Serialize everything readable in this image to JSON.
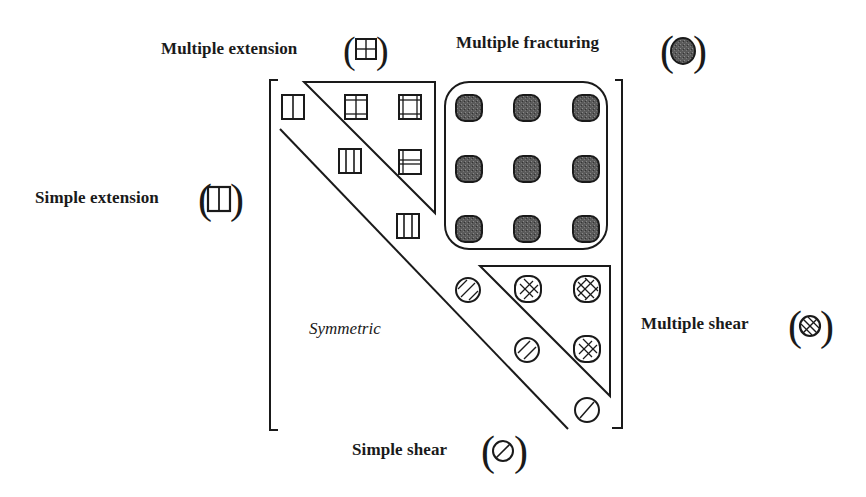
{
  "labels": {
    "multiple_extension": "Multiple extension",
    "multiple_fracturing": "Multiple fracturing",
    "simple_extension": "Simple extension",
    "multiple_shear": "Multiple shear",
    "simple_shear": "Simple shear",
    "symmetric": "Symmetric"
  },
  "legend_symbols": [
    {
      "label": "Multiple extension",
      "icon": "grid-square-icon"
    },
    {
      "label": "Multiple fracturing",
      "icon": "filled-rounded-square-icon"
    },
    {
      "label": "Simple extension",
      "icon": "split-square-icon"
    },
    {
      "label": "Multiple shear",
      "icon": "crosshatched-circle-icon"
    },
    {
      "label": "Simple shear",
      "icon": "slashed-circle-icon"
    }
  ],
  "matrix": {
    "size": 6,
    "description": "Upper-triangular symmetric matrix of fracture modes",
    "regions": [
      {
        "name": "Simple extension",
        "cells": [
          [
            1,
            1
          ],
          [
            2,
            2
          ],
          [
            3,
            3
          ]
        ]
      },
      {
        "name": "Multiple extension",
        "cells": [
          [
            1,
            2
          ],
          [
            1,
            3
          ],
          [
            2,
            3
          ]
        ]
      },
      {
        "name": "Multiple fracturing",
        "cells": [
          [
            1,
            4
          ],
          [
            1,
            5
          ],
          [
            1,
            6
          ],
          [
            2,
            4
          ],
          [
            2,
            5
          ],
          [
            2,
            6
          ],
          [
            3,
            4
          ],
          [
            3,
            5
          ],
          [
            3,
            6
          ]
        ]
      },
      {
        "name": "Simple shear",
        "cells": [
          [
            4,
            4
          ],
          [
            5,
            5
          ],
          [
            6,
            6
          ]
        ]
      },
      {
        "name": "Multiple shear",
        "cells": [
          [
            4,
            5
          ],
          [
            4,
            6
          ],
          [
            5,
            6
          ]
        ]
      },
      {
        "name": "Symmetric",
        "cells": "lower triangle"
      }
    ]
  },
  "colors": {
    "ink": "#1a1a1a",
    "fill_dark": "#555555",
    "background": "#ffffff"
  }
}
